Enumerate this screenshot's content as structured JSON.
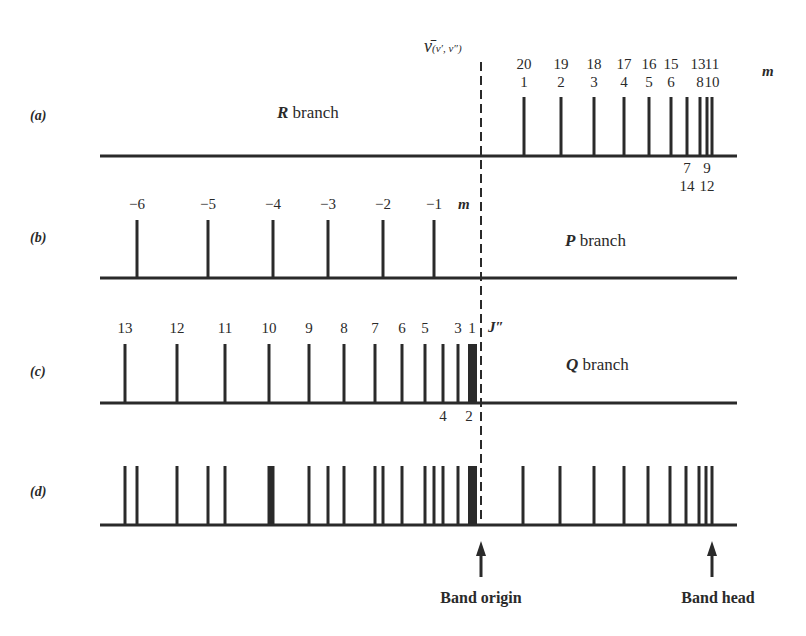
{
  "figure": {
    "origin_symbol": "ν̄",
    "origin_subscript": "(v′, v″)",
    "band_origin_x": 481,
    "band_head_x": 712,
    "captions": {
      "band_origin": "Band origin",
      "band_head": "Band head"
    },
    "rows": [
      {
        "id": "a",
        "label": "(a)",
        "branch_name": "R",
        "branch_suffix": " branch",
        "baseline_y": 156,
        "top_y": 97,
        "x_start": 100,
        "x_end": 737,
        "index_label": "m",
        "lines": [
          524,
          561,
          594,
          624,
          649,
          671,
          687,
          700,
          707,
          712
        ],
        "top_labels_row1": [
          {
            "x": 524,
            "t": "20"
          },
          {
            "x": 561,
            "t": "19"
          },
          {
            "x": 594,
            "t": "18"
          },
          {
            "x": 624,
            "t": "17"
          },
          {
            "x": 649,
            "t": "16"
          },
          {
            "x": 671,
            "t": "15"
          },
          {
            "x": 698,
            "t": "13"
          },
          {
            "x": 712,
            "t": "11"
          }
        ],
        "top_labels_row2": [
          {
            "x": 524,
            "t": "1"
          },
          {
            "x": 561,
            "t": "2"
          },
          {
            "x": 594,
            "t": "3"
          },
          {
            "x": 624,
            "t": "4"
          },
          {
            "x": 649,
            "t": "5"
          },
          {
            "x": 671,
            "t": "6"
          },
          {
            "x": 700,
            "t": "8"
          },
          {
            "x": 712,
            "t": "10"
          }
        ],
        "bottom_labels_row1": [
          {
            "x": 687,
            "t": "7"
          },
          {
            "x": 707,
            "t": "9"
          }
        ],
        "bottom_labels_row2": [
          {
            "x": 687,
            "t": "14"
          },
          {
            "x": 707,
            "t": "12"
          }
        ]
      },
      {
        "id": "b",
        "label": "(b)",
        "branch_name": "P",
        "branch_suffix": " branch",
        "baseline_y": 278,
        "top_y": 220,
        "x_start": 100,
        "x_end": 737,
        "index_label": "m",
        "lines": [
          137,
          208,
          273,
          328,
          383,
          434
        ],
        "top_labels_row1": [
          {
            "x": 137,
            "t": "−6"
          },
          {
            "x": 208,
            "t": "−5"
          },
          {
            "x": 273,
            "t": "−4"
          },
          {
            "x": 328,
            "t": "−3"
          },
          {
            "x": 383,
            "t": "−2"
          },
          {
            "x": 434,
            "t": "−1"
          }
        ]
      },
      {
        "id": "c",
        "label": "(c)",
        "branch_name": "Q",
        "branch_suffix": " branch",
        "baseline_y": 403,
        "top_y": 344,
        "x_start": 100,
        "x_end": 737,
        "index_label": "J″",
        "lines": [
          125,
          177,
          225,
          269,
          309,
          344,
          375,
          402,
          425,
          443,
          458
        ],
        "block": {
          "x1": 468,
          "x2": 477
        },
        "top_labels_row1": [
          {
            "x": 125,
            "t": "13"
          },
          {
            "x": 177,
            "t": "12"
          },
          {
            "x": 225,
            "t": "11"
          },
          {
            "x": 269,
            "t": "10"
          },
          {
            "x": 309,
            "t": "9"
          },
          {
            "x": 344,
            "t": "8"
          },
          {
            "x": 375,
            "t": "7"
          },
          {
            "x": 402,
            "t": "6"
          },
          {
            "x": 425,
            "t": "5"
          },
          {
            "x": 458,
            "t": "3"
          },
          {
            "x": 472,
            "t": "1"
          }
        ],
        "bottom_labels_row1": [
          {
            "x": 443,
            "t": "4"
          },
          {
            "x": 469,
            "t": "2"
          }
        ]
      },
      {
        "id": "d",
        "label": "(d)",
        "branch_name": "",
        "branch_suffix": "",
        "baseline_y": 525,
        "top_y": 466,
        "x_start": 100,
        "x_end": 737,
        "lines": [
          125,
          137,
          177,
          208,
          225,
          269,
          271,
          273,
          309,
          328,
          344,
          375,
          383,
          402,
          425,
          434,
          443,
          458,
          523,
          560,
          594,
          624,
          648,
          670,
          686,
          699,
          706,
          712
        ],
        "block": {
          "x1": 468,
          "x2": 477
        }
      }
    ]
  },
  "chart_data": {
    "type": "stick-spectrum",
    "x_axis": "wavenumber (increasing to the right)",
    "band_origin_label": "ν̄(v′,v″)",
    "annotations": [
      "Band origin",
      "Band head"
    ],
    "panels": [
      {
        "panel": "(a)",
        "name": "R branch",
        "index": "m",
        "m_values_upper": [
          20,
          19,
          18,
          17,
          16,
          15,
          13,
          11
        ],
        "m_values_lower": [
          1,
          2,
          3,
          4,
          5,
          6,
          8,
          10
        ],
        "m_values_below": [
          [
            7,
            14
          ],
          [
            9,
            12
          ]
        ],
        "x_px": [
          524,
          561,
          594,
          624,
          649,
          671,
          687,
          700,
          707,
          712
        ]
      },
      {
        "panel": "(b)",
        "name": "P branch",
        "index": "m",
        "m_values": [
          -6,
          -5,
          -4,
          -3,
          -2,
          -1
        ],
        "x_px": [
          137,
          208,
          273,
          328,
          383,
          434
        ]
      },
      {
        "panel": "(c)",
        "name": "Q branch",
        "index": "J″",
        "J_values_above": [
          13,
          12,
          11,
          10,
          9,
          8,
          7,
          6,
          5,
          3,
          1
        ],
        "J_values_below": [
          4,
          2
        ],
        "x_px": [
          125,
          177,
          225,
          269,
          309,
          344,
          375,
          402,
          425,
          443,
          458,
          472
        ]
      },
      {
        "panel": "(d)",
        "name": "Combined band",
        "index": "",
        "x_px": [
          125,
          137,
          177,
          208,
          225,
          271,
          309,
          328,
          344,
          375,
          383,
          402,
          425,
          434,
          443,
          458,
          472,
          523,
          560,
          594,
          624,
          648,
          670,
          686,
          699,
          706,
          712
        ]
      }
    ]
  }
}
